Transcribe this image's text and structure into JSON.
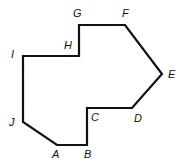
{
  "diagram": {
    "type": "polygon",
    "stroke_color": "#111111",
    "background": "#ffffff",
    "vertices": [
      {
        "label": "A",
        "x": 57,
        "y": 145,
        "label_x": 52,
        "label_y": 158
      },
      {
        "label": "B",
        "x": 87,
        "y": 145,
        "label_x": 84,
        "label_y": 158
      },
      {
        "label": "C",
        "x": 87,
        "y": 108,
        "label_x": 91,
        "label_y": 121
      },
      {
        "label": "D",
        "x": 132,
        "y": 108,
        "label_x": 134,
        "label_y": 122
      },
      {
        "label": "E",
        "x": 162,
        "y": 74,
        "label_x": 168,
        "label_y": 78
      },
      {
        "label": "F",
        "x": 125,
        "y": 25,
        "label_x": 122,
        "label_y": 17
      },
      {
        "label": "G",
        "x": 79,
        "y": 25,
        "label_x": 73,
        "label_y": 17
      },
      {
        "label": "H",
        "x": 79,
        "y": 56,
        "label_x": 64,
        "label_y": 49
      },
      {
        "label": "I",
        "x": 23,
        "y": 56,
        "label_x": 11,
        "label_y": 58
      },
      {
        "label": "J",
        "x": 23,
        "y": 122,
        "label_x": 9,
        "label_y": 126
      }
    ]
  }
}
